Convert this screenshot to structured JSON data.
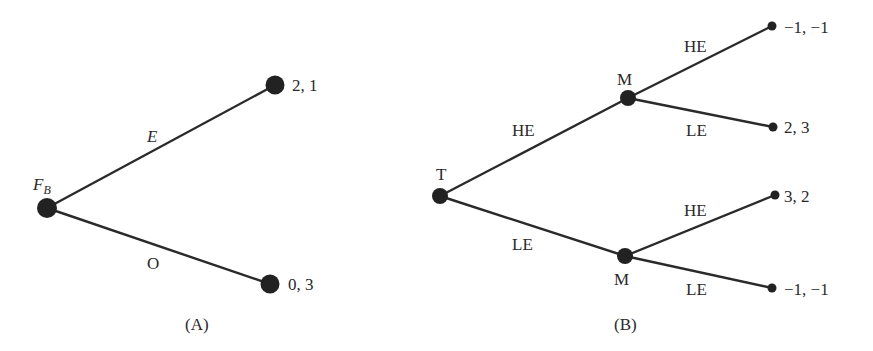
{
  "panel_a": {
    "caption": "(A)",
    "root": {
      "label_main": "F",
      "label_sub": "B"
    },
    "edges": [
      {
        "label": "E",
        "italic": true
      },
      {
        "label": "O",
        "italic": false
      }
    ],
    "leaves": [
      {
        "payoff": "2, 1"
      },
      {
        "payoff": "0, 3"
      }
    ]
  },
  "panel_b": {
    "caption": "(B)",
    "root": {
      "label": "T"
    },
    "inner_nodes": [
      {
        "label": "M"
      },
      {
        "label": "M"
      }
    ],
    "root_edges": [
      {
        "label": "HE"
      },
      {
        "label": "LE"
      }
    ],
    "inner_edges": [
      {
        "label": "HE"
      },
      {
        "label": "LE"
      },
      {
        "label": "HE"
      },
      {
        "label": "LE"
      }
    ],
    "leaves": [
      {
        "payoff": "−1, −1"
      },
      {
        "payoff": "2, 3"
      },
      {
        "payoff": "3, 2"
      },
      {
        "payoff": "−1, −1"
      }
    ]
  },
  "colors": {
    "ink": "#222222",
    "background": "#ffffff"
  }
}
